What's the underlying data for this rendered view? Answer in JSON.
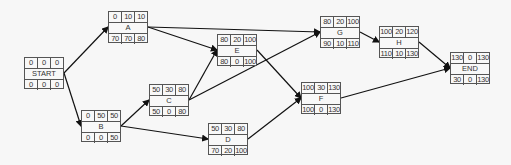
{
  "nodes": [
    {
      "id": "START",
      "label": "START",
      "top": [
        "0",
        "0",
        "0"
      ],
      "bottom": [
        "0",
        "0",
        "0"
      ],
      "x": 24,
      "y": 57
    },
    {
      "id": "A",
      "label": "A",
      "top": [
        "0",
        "10",
        "10"
      ],
      "bottom": [
        "70",
        "70",
        "80"
      ],
      "x": 108,
      "y": 11
    },
    {
      "id": "B",
      "label": "B",
      "top": [
        "0",
        "50",
        "50"
      ],
      "bottom": [
        "0",
        "0",
        "50"
      ],
      "x": 81,
      "y": 110
    },
    {
      "id": "C",
      "label": "C",
      "top": [
        "50",
        "30",
        "80"
      ],
      "bottom": [
        "50",
        "0",
        "80"
      ],
      "x": 149,
      "y": 84
    },
    {
      "id": "D",
      "label": "D",
      "top": [
        "50",
        "30",
        "80"
      ],
      "bottom": [
        "70",
        "20",
        "100"
      ],
      "x": 208,
      "y": 123
    },
    {
      "id": "E",
      "label": "E",
      "top": [
        "80",
        "20",
        "100"
      ],
      "bottom": [
        "80",
        "0",
        "100"
      ],
      "x": 217,
      "y": 34
    },
    {
      "id": "F",
      "label": "F",
      "top": [
        "100",
        "30",
        "130"
      ],
      "bottom": [
        "100",
        "0",
        "130"
      ],
      "x": 301,
      "y": 82
    },
    {
      "id": "G",
      "label": "G",
      "top": [
        "80",
        "20",
        "100"
      ],
      "bottom": [
        "90",
        "10",
        "110"
      ],
      "x": 320,
      "y": 16
    },
    {
      "id": "H",
      "label": "H",
      "top": [
        "100",
        "20",
        "120"
      ],
      "bottom": [
        "110",
        "10",
        "130"
      ],
      "x": 379,
      "y": 26
    },
    {
      "id": "END",
      "label": "END",
      "top": [
        "130",
        "0",
        "130"
      ],
      "bottom": [
        "30",
        "0",
        "130"
      ],
      "x": 450,
      "y": 52
    }
  ],
  "edges": [
    [
      "START",
      "A"
    ],
    [
      "START",
      "B"
    ],
    [
      "A",
      "G"
    ],
    [
      "A",
      "E"
    ],
    [
      "B",
      "C"
    ],
    [
      "B",
      "D"
    ],
    [
      "C",
      "E"
    ],
    [
      "C",
      "G"
    ],
    [
      "E",
      "F"
    ],
    [
      "D",
      "F"
    ],
    [
      "G",
      "H"
    ],
    [
      "H",
      "END"
    ],
    [
      "F",
      "END"
    ]
  ]
}
